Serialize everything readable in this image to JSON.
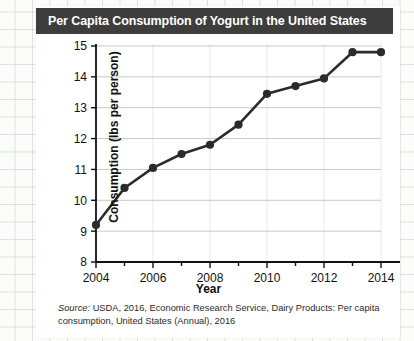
{
  "figure": {
    "title": "Per Capita Consumption of Yogurt in the United States",
    "source_label": "Source:",
    "source_text": " USDA, 2016, Economic Research Service, Dairy Products: Per capita consumption, United States (Annual), 2016",
    "title_bar_color": "#3d3d3d",
    "line_color": "#2b2b2b",
    "grid_color": "#c8c8c8"
  },
  "chart_data": {
    "type": "line",
    "title": "Per Capita Consumption of Yogurt in the United States",
    "xlabel": "Year",
    "ylabel": "Consumption (lbs per person)",
    "x": [
      2004,
      2005,
      2006,
      2007,
      2008,
      2009,
      2010,
      2011,
      2012,
      2013,
      2014
    ],
    "values": [
      9.2,
      10.4,
      11.05,
      11.5,
      11.8,
      12.45,
      13.45,
      13.7,
      13.95,
      14.8,
      14.8
    ],
    "xlim": [
      2004,
      2014
    ],
    "ylim": [
      8,
      15
    ],
    "ytick_labels": [
      "15",
      "14",
      "13",
      "12",
      "11",
      "10",
      "9",
      "8"
    ],
    "yticks": [
      15,
      14,
      13,
      12,
      11,
      10,
      9,
      8
    ],
    "xtick_labels": [
      "2004",
      "2006",
      "2008",
      "2010",
      "2012",
      "2014"
    ],
    "xticks_major": [
      2004,
      2006,
      2008,
      2010,
      2012,
      2014
    ],
    "xticks_minor": [
      2005,
      2007,
      2009,
      2011,
      2013
    ],
    "grid": "horizontal",
    "legend": "none",
    "marker": "circle"
  }
}
